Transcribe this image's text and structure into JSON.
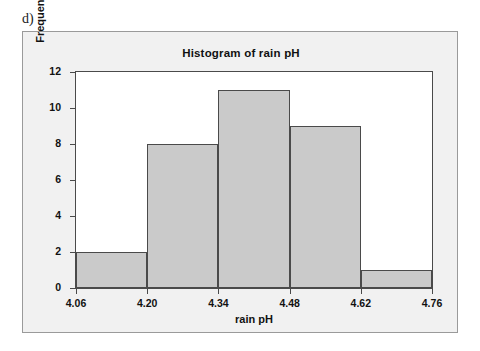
{
  "figure": {
    "panel_letter": "d)",
    "background_color": "#ffffff",
    "panel_background_color": "#f1f1f1",
    "panel_border_color": "#9a9a9a"
  },
  "chart_data": {
    "type": "bar",
    "title": "Histogram of rain pH",
    "xlabel": "rain pH",
    "ylabel": "Frequency",
    "bin_edges": [
      4.06,
      4.2,
      4.34,
      4.48,
      4.62,
      4.76
    ],
    "bin_width": 0.14,
    "categories": [
      "4.06-4.20",
      "4.20-4.34",
      "4.34-4.48",
      "4.48-4.62",
      "4.62-4.76"
    ],
    "values": [
      2,
      8,
      11,
      9,
      1
    ],
    "xlim": [
      4.06,
      4.76
    ],
    "ylim": [
      0,
      12
    ],
    "x_ticks": [
      4.06,
      4.2,
      4.34,
      4.48,
      4.62,
      4.76
    ],
    "x_tick_labels": [
      "4.06",
      "4.20",
      "4.34",
      "4.48",
      "4.62",
      "4.76"
    ],
    "y_ticks": [
      0,
      2,
      4,
      6,
      8,
      10,
      12
    ],
    "y_tick_labels": [
      "0",
      "2",
      "4",
      "6",
      "8",
      "10",
      "12"
    ],
    "grid": false,
    "legend": false,
    "bar_fill_color": "#cacaca",
    "bar_edge_color": "#4a4a4a",
    "plot_background_color": "#ffffff",
    "total_count": 31
  }
}
